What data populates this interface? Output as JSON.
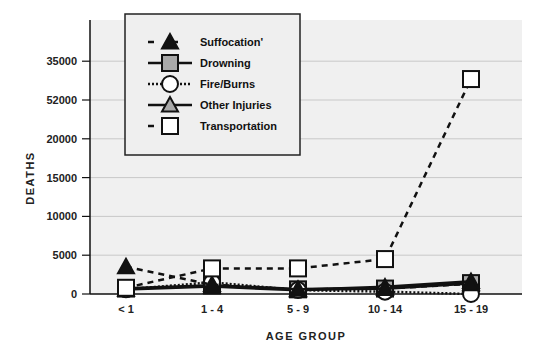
{
  "chart_data": {
    "type": "line",
    "title": "",
    "xlabel": "AGE GROUP",
    "ylabel": "DEATHS",
    "categories": [
      "< 1",
      "1 - 4",
      "5 - 9",
      "10 - 14",
      "15 - 19"
    ],
    "y_tick_labels": [
      "0",
      "5000",
      "10000",
      "15000",
      "20000",
      "52000",
      "35000"
    ],
    "y_tick_positions": [
      0,
      5000,
      10000,
      15000,
      20000,
      25000,
      30000
    ],
    "ylim": [
      0,
      31000
    ],
    "grid": true,
    "legend_position": "top-left (inset box)",
    "series": [
      {
        "name": "Suffocation",
        "legend_label": "Suffocation'",
        "marker": "triangle",
        "marker_fill": "#111111",
        "line": "dashed",
        "values": [
          3500,
          1200,
          600,
          700,
          1300
        ]
      },
      {
        "name": "Drowning",
        "legend_label": "Drowning",
        "marker": "square",
        "marker_fill": "#a9a9a9",
        "line": "solid",
        "values": [
          700,
          1100,
          600,
          700,
          1400
        ]
      },
      {
        "name": "Fire/Burns",
        "legend_label": "Fire/Burns",
        "marker": "circle",
        "marker_fill": "#ffffff",
        "line": "dotted",
        "values": [
          600,
          1500,
          500,
          300,
          0
        ]
      },
      {
        "name": "Other Injuries",
        "legend_label": "Other Injuries",
        "marker": "triangle",
        "marker_fill": "#a9a9a9",
        "line": "solid",
        "values": [
          600,
          1000,
          500,
          900,
          1600
        ]
      },
      {
        "name": "Transportation",
        "legend_label": "Transportation",
        "marker": "square",
        "marker_fill": "#ffffff",
        "line": "dashed",
        "values": [
          800,
          3300,
          3300,
          4500,
          27700
        ]
      }
    ]
  }
}
